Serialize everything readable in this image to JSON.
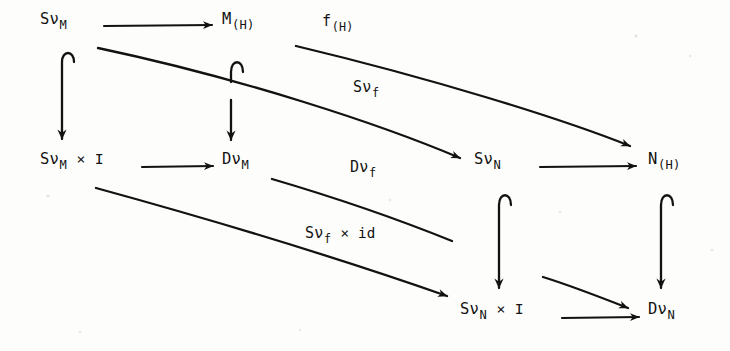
{
  "diagram": {
    "kind": "commutative-diagram",
    "background_color": "#fdfdfb",
    "ink_color": "#121212",
    "nodes": [
      {
        "id": "svm",
        "base": "Sν",
        "sub": "M",
        "suffix": "",
        "text": "SνM",
        "x": 40,
        "y": 12
      },
      {
        "id": "mh",
        "base": "M",
        "sub": "(H)",
        "suffix": "",
        "text": "M(H)",
        "x": 222,
        "y": 12
      },
      {
        "id": "svm_i",
        "base": "Sν",
        "sub": "M",
        "suffix": " × I",
        "text": "SνM × I",
        "x": 40,
        "y": 152
      },
      {
        "id": "dvm",
        "base": "Dν",
        "sub": "M",
        "suffix": "",
        "text": "DνM",
        "x": 222,
        "y": 152
      },
      {
        "id": "svn",
        "base": "Sν",
        "sub": "N",
        "suffix": "",
        "text": "SνN",
        "x": 474,
        "y": 152
      },
      {
        "id": "nh",
        "base": "N",
        "sub": "(H)",
        "suffix": "",
        "text": "N(H)",
        "x": 648,
        "y": 152
      },
      {
        "id": "svn_i",
        "base": "Sν",
        "sub": "N",
        "suffix": " × I",
        "text": "SνN × I",
        "x": 460,
        "y": 302
      },
      {
        "id": "dvn",
        "base": "Dν",
        "sub": "N",
        "suffix": "",
        "text": "DνN",
        "x": 648,
        "y": 302
      }
    ],
    "edge_labels": [
      {
        "id": "f_h",
        "base": "f",
        "sub": "(H)",
        "suffix": "",
        "text": "f(H)",
        "x": 322,
        "y": 14
      },
      {
        "id": "sv_f_top",
        "base": "Sν",
        "sub": "f",
        "suffix": "",
        "text": "Sνf",
        "x": 353,
        "y": 80
      },
      {
        "id": "dv_f",
        "base": "Dν",
        "sub": "f",
        "suffix": "",
        "text": "Dνf",
        "x": 350,
        "y": 160
      },
      {
        "id": "sv_f_id",
        "base": "Sν",
        "sub": "f",
        "suffix": " × id",
        "text": "Sνf × id",
        "x": 305,
        "y": 226
      }
    ],
    "arrows": [
      {
        "id": "svm-to-mh",
        "type": "straight",
        "from": "svm",
        "to": "mh"
      },
      {
        "id": "svm-to-svm_i",
        "type": "hook",
        "from": "svm",
        "to": "svm_i"
      },
      {
        "id": "mh-to-dvm",
        "type": "hook",
        "from": "mh",
        "to": "dvm"
      },
      {
        "id": "svm_i-to-dvm",
        "type": "straight",
        "from": "svm_i",
        "to": "dvm"
      },
      {
        "id": "dvm-to-svn",
        "type": "diagonal",
        "from": "dvm",
        "to": "svn",
        "label": "sv_f_top"
      },
      {
        "id": "mh-to-nh",
        "type": "diagonal",
        "from": "mh",
        "to": "nh",
        "label": "f_h"
      },
      {
        "id": "svn-to-nh",
        "type": "straight",
        "from": "svn",
        "to": "nh"
      },
      {
        "id": "svn-to-svn_i",
        "type": "hook",
        "from": "svn",
        "to": "svn_i"
      },
      {
        "id": "nh-to-dvn",
        "type": "hook",
        "from": "nh",
        "to": "dvn"
      },
      {
        "id": "svn_i-to-dvn",
        "type": "straight",
        "from": "svn_i",
        "to": "dvn"
      },
      {
        "id": "svm_i-to-svn_i",
        "type": "diagonal",
        "from": "svm_i",
        "to": "svn_i",
        "label": "sv_f_id"
      },
      {
        "id": "dvm-to-dvn",
        "type": "diagonal",
        "from": "dvm",
        "to": "dvn",
        "label": "dv_f"
      }
    ]
  }
}
